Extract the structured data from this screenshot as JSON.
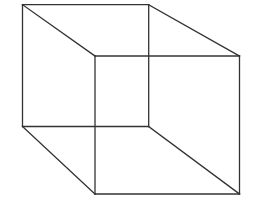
{
  "diagram": {
    "type": "wireframe-cube",
    "stroke_color": "#333333",
    "background": "#ffffff",
    "stroke_width": 1.3,
    "back_face": {
      "tl": [
        22.5,
        4.7
      ],
      "tr": [
        148.7,
        4.7
      ],
      "br": [
        148.7,
        126.5
      ],
      "bl": [
        22.5,
        126.5
      ]
    },
    "front_face": {
      "tl": [
        95,
        56
      ],
      "tr": [
        239.5,
        56
      ],
      "br": [
        239.5,
        194
      ],
      "bl": [
        95,
        194
      ]
    }
  }
}
